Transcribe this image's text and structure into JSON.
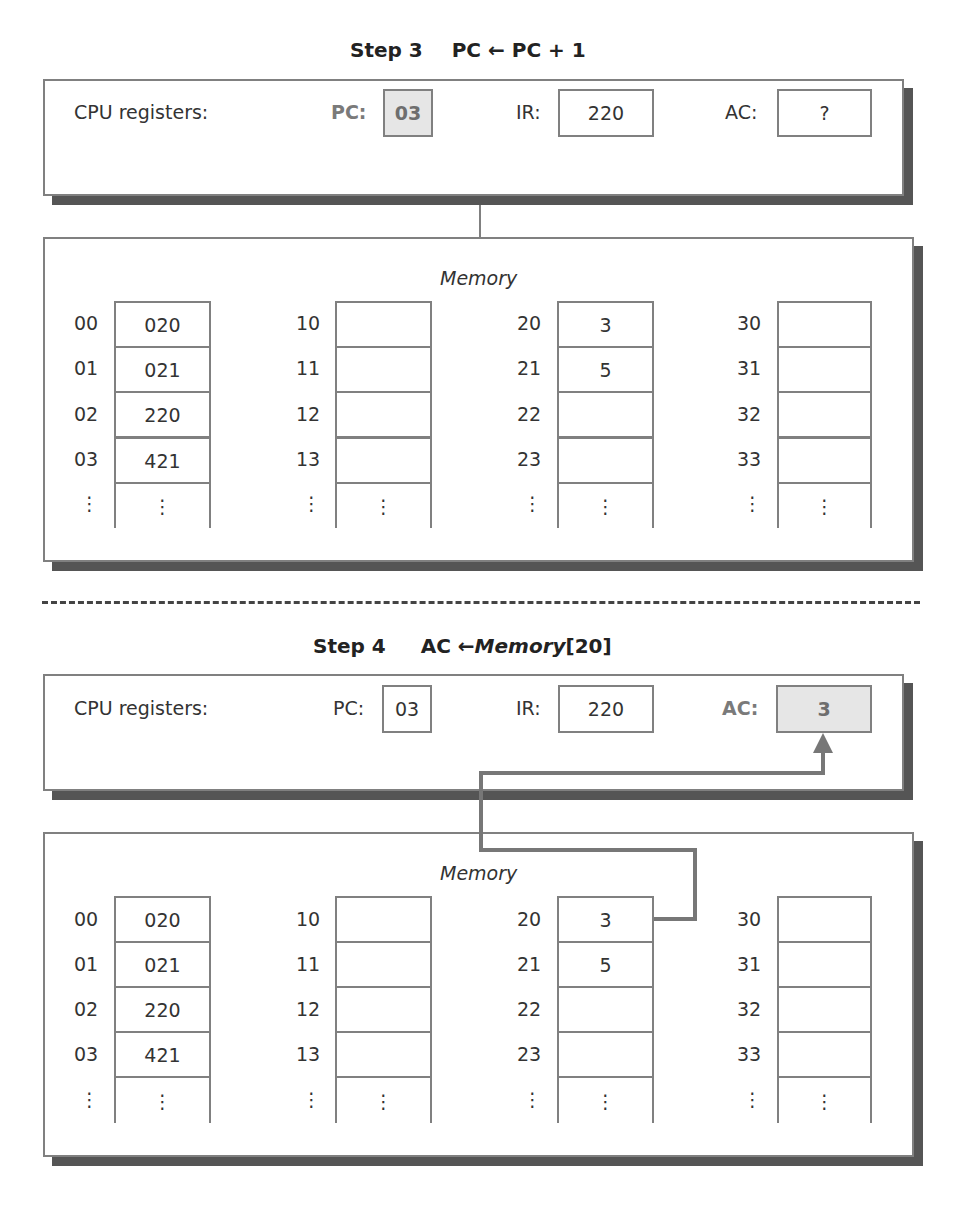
{
  "steps": [
    {
      "title": "Step 3",
      "operation": "PC ← PC + 1",
      "registers_label": "CPU registers:",
      "registers": [
        {
          "name": "PC:",
          "value": "03",
          "highlight": true
        },
        {
          "name": "IR:",
          "value": "220",
          "highlight": false
        },
        {
          "name": "AC:",
          "value": "?",
          "highlight": false
        }
      ],
      "memory_title": "Memory",
      "memory_columns": [
        {
          "addresses": [
            "00",
            "01",
            "02",
            "03",
            "⋮"
          ],
          "values": [
            "020",
            "021",
            "220",
            "421",
            "⋮"
          ]
        },
        {
          "addresses": [
            "10",
            "11",
            "12",
            "13",
            "⋮"
          ],
          "values": [
            "",
            "",
            "",
            "",
            "⋮"
          ]
        },
        {
          "addresses": [
            "20",
            "21",
            "22",
            "23",
            "⋮"
          ],
          "values": [
            "3",
            "5",
            "",
            "",
            "⋮"
          ]
        },
        {
          "addresses": [
            "30",
            "31",
            "32",
            "33",
            "⋮"
          ],
          "values": [
            "",
            "",
            "",
            "",
            "⋮"
          ]
        }
      ]
    },
    {
      "title": "Step 4",
      "operation_prefix": "AC ←",
      "operation_memory": "Memory",
      "operation_suffix": "[20]",
      "registers_label": "CPU registers:",
      "registers": [
        {
          "name": "PC:",
          "value": "03",
          "highlight": false
        },
        {
          "name": "IR:",
          "value": "220",
          "highlight": false
        },
        {
          "name": "AC:",
          "value": "3",
          "highlight": true
        }
      ],
      "memory_title": "Memory",
      "memory_columns": [
        {
          "addresses": [
            "00",
            "01",
            "02",
            "03",
            "⋮"
          ],
          "values": [
            "020",
            "021",
            "220",
            "421",
            "⋮"
          ]
        },
        {
          "addresses": [
            "10",
            "11",
            "12",
            "13",
            "⋮"
          ],
          "values": [
            "",
            "",
            "",
            "",
            "⋮"
          ]
        },
        {
          "addresses": [
            "20",
            "21",
            "22",
            "23",
            "⋮"
          ],
          "values": [
            "3",
            "5",
            "",
            "",
            "⋮"
          ]
        },
        {
          "addresses": [
            "30",
            "31",
            "32",
            "33",
            "⋮"
          ],
          "values": [
            "",
            "",
            "",
            "",
            "⋮"
          ]
        }
      ]
    }
  ],
  "colors": {
    "border": "#808080",
    "shadow": "#555555",
    "highlight_fill": "#e6e6e6",
    "highlight_text": "#7a7a7a",
    "arrow": "#777777"
  }
}
